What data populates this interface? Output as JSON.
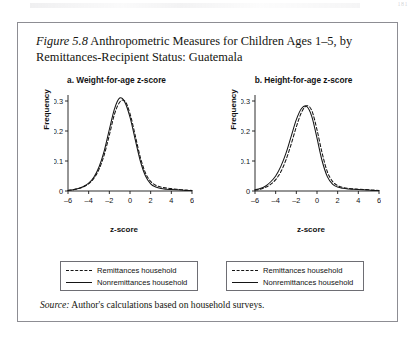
{
  "page": {
    "number": "181"
  },
  "figure": {
    "label": "Figure 5.8",
    "title": "Anthropometric Measures for Children Ages 1–5, by Remittances-Recipient Status: Guatemala",
    "source_label": "Source:",
    "source_text": "Author's calculations based on household surveys."
  },
  "legend": {
    "dashed_label": "Remittances household",
    "solid_label": "Nonremittances household"
  },
  "chart_data": [
    {
      "id": "weight-for-age",
      "type": "line",
      "title": "a. Weight-for-age z-score",
      "xlabel": "z-score",
      "ylabel": "Frequency",
      "xlim": [
        -6,
        6
      ],
      "ylim": [
        0,
        0.32
      ],
      "xticks": [
        -6,
        -4,
        -2,
        0,
        2,
        4,
        6
      ],
      "xtick_labels": [
        "–6",
        "–4",
        "–2",
        "0",
        "2",
        "4",
        "6"
      ],
      "yticks": [
        0,
        0.1,
        0.2,
        0.3
      ],
      "ytick_labels": [
        "0",
        "0.1",
        "0.2",
        "0.3"
      ],
      "grid": false,
      "legend_position": "below",
      "x": [
        -6.0,
        -5.5,
        -5.0,
        -4.5,
        -4.0,
        -3.5,
        -3.0,
        -2.5,
        -2.0,
        -1.5,
        -1.0,
        -0.5,
        0.0,
        0.5,
        1.0,
        1.5,
        2.0,
        2.5,
        3.0,
        3.5,
        4.0,
        4.5,
        5.0,
        5.5,
        6.0
      ],
      "series": [
        {
          "name": "Remittances household",
          "style": "dashed",
          "values": [
            0.002,
            0.004,
            0.008,
            0.014,
            0.024,
            0.042,
            0.072,
            0.12,
            0.186,
            0.256,
            0.296,
            0.3,
            0.258,
            0.186,
            0.112,
            0.06,
            0.032,
            0.019,
            0.013,
            0.01,
            0.008,
            0.006,
            0.004,
            0.003,
            0.002
          ]
        },
        {
          "name": "Nonremittances household",
          "style": "solid",
          "values": [
            0.002,
            0.004,
            0.008,
            0.015,
            0.026,
            0.046,
            0.08,
            0.133,
            0.205,
            0.274,
            0.31,
            0.296,
            0.246,
            0.172,
            0.1,
            0.05,
            0.024,
            0.013,
            0.008,
            0.006,
            0.005,
            0.004,
            0.003,
            0.002,
            0.002
          ]
        }
      ]
    },
    {
      "id": "height-for-age",
      "type": "line",
      "title": "b. Height-for-age z-score",
      "xlabel": "z-score",
      "ylabel": "Frequency",
      "xlim": [
        -6,
        6
      ],
      "ylim": [
        0,
        0.32
      ],
      "xticks": [
        -6,
        -4,
        -2,
        0,
        2,
        4,
        6
      ],
      "xtick_labels": [
        "–6",
        "–4",
        "–2",
        "0",
        "2",
        "4",
        "6"
      ],
      "yticks": [
        0,
        0.1,
        0.2,
        0.3
      ],
      "ytick_labels": [
        "0",
        "0.1",
        "0.2",
        "0.3"
      ],
      "grid": false,
      "legend_position": "below",
      "x": [
        -6.0,
        -5.5,
        -5.0,
        -4.5,
        -4.0,
        -3.5,
        -3.0,
        -2.5,
        -2.0,
        -1.5,
        -1.0,
        -0.5,
        0.0,
        0.5,
        1.0,
        1.5,
        2.0,
        2.5,
        3.0,
        3.5,
        4.0,
        4.5,
        5.0,
        5.5,
        6.0
      ],
      "series": [
        {
          "name": "Remittances household",
          "style": "dashed",
          "values": [
            0.003,
            0.006,
            0.012,
            0.022,
            0.038,
            0.064,
            0.104,
            0.156,
            0.214,
            0.262,
            0.284,
            0.268,
            0.204,
            0.126,
            0.064,
            0.032,
            0.018,
            0.012,
            0.009,
            0.007,
            0.006,
            0.005,
            0.004,
            0.003,
            0.002
          ]
        },
        {
          "name": "Nonremittances household",
          "style": "solid",
          "values": [
            0.004,
            0.008,
            0.016,
            0.03,
            0.05,
            0.082,
            0.126,
            0.182,
            0.238,
            0.275,
            0.282,
            0.248,
            0.176,
            0.1,
            0.048,
            0.023,
            0.013,
            0.009,
            0.007,
            0.006,
            0.005,
            0.004,
            0.003,
            0.002,
            0.002
          ]
        }
      ]
    }
  ]
}
